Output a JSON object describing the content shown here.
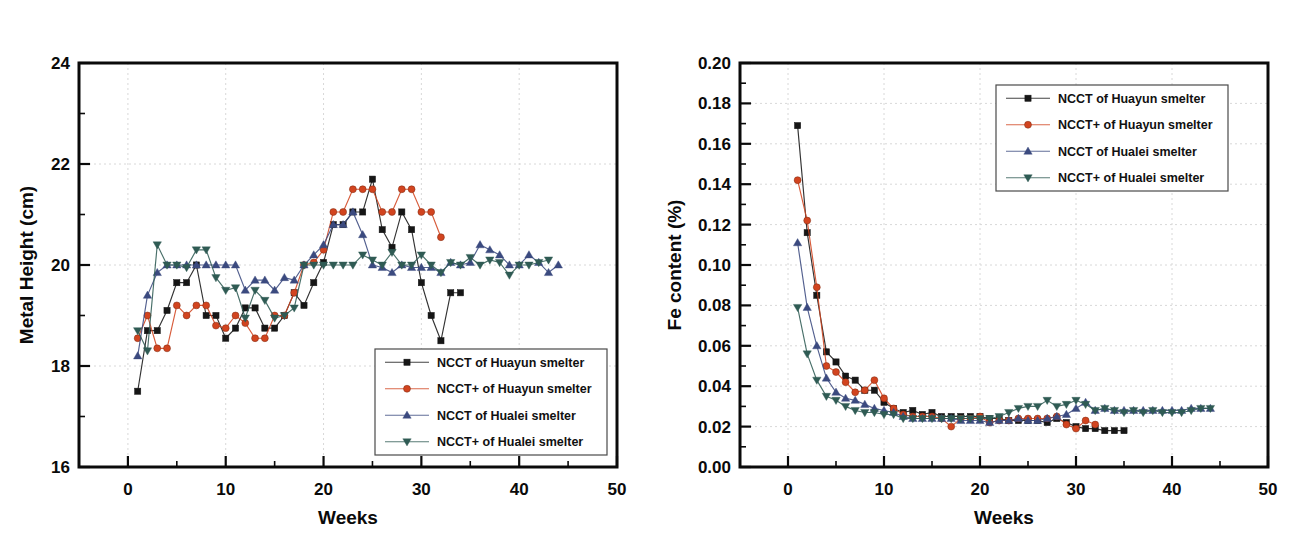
{
  "figure": {
    "background": "#ffffff",
    "panel_count": 2
  },
  "legend_entries": [
    {
      "label": "NCCT   of Huayun smelter",
      "color": "#161616",
      "marker": "square"
    },
    {
      "label": "NCCT+ of Huayun smelter",
      "color": "#d2441f",
      "marker": "circle"
    },
    {
      "label": "NCCT   of Hualei smelter",
      "color": "#3b4a7f",
      "marker": "triangle-up"
    },
    {
      "label": "NCCT+ of Hualei smelter",
      "color": "#2f5b54",
      "marker": "triangle-down"
    }
  ],
  "chart_data": [
    {
      "id": "metal-height",
      "type": "line",
      "title": "",
      "xlabel": "Weeks",
      "ylabel": "Metal Height (cm)",
      "xlim": [
        -5,
        50
      ],
      "ylim": [
        16,
        24
      ],
      "xticks": [
        0,
        10,
        20,
        30,
        40,
        50
      ],
      "xtick_labels": [
        "0",
        "10",
        "20",
        "30",
        "40",
        "50"
      ],
      "yticks": [
        16,
        18,
        20,
        22,
        24
      ],
      "ytick_labels": [
        "16",
        "18",
        "20",
        "22",
        "24"
      ],
      "x_minor_step": 5,
      "y_minor_step": 1,
      "grid": true,
      "legend_position": "bottom-right",
      "series": [
        {
          "name": "NCCT   of Huayun smelter",
          "color": "#161616",
          "marker": "square",
          "x": [
            1,
            2,
            3,
            4,
            5,
            6,
            7,
            8,
            9,
            10,
            11,
            12,
            13,
            14,
            15,
            16,
            17,
            18,
            19,
            20,
            21,
            22,
            23,
            24,
            25,
            26,
            27,
            28,
            29,
            30,
            31,
            32,
            33,
            34
          ],
          "values": [
            17.5,
            18.7,
            18.7,
            19.1,
            19.65,
            19.65,
            20.0,
            19.0,
            19.0,
            18.55,
            18.75,
            19.15,
            19.15,
            18.75,
            18.75,
            19.0,
            19.45,
            19.2,
            19.65,
            20.05,
            20.8,
            20.8,
            21.05,
            21.05,
            21.7,
            20.7,
            20.35,
            21.05,
            20.7,
            19.65,
            19.0,
            18.5,
            19.45,
            19.45
          ]
        },
        {
          "name": "NCCT+ of Huayun smelter",
          "color": "#d2441f",
          "marker": "circle",
          "x": [
            1,
            2,
            3,
            4,
            5,
            6,
            7,
            8,
            9,
            10,
            11,
            12,
            13,
            14,
            15,
            16,
            17,
            18,
            19,
            20,
            21,
            22,
            23,
            24,
            25,
            26,
            27,
            28,
            29,
            30,
            31,
            32
          ],
          "values": [
            18.55,
            19.0,
            18.35,
            18.35,
            19.2,
            19.0,
            19.2,
            19.2,
            18.8,
            18.75,
            19.0,
            18.85,
            18.55,
            18.55,
            19.0,
            19.0,
            19.45,
            20.0,
            20.05,
            20.3,
            21.05,
            21.05,
            21.5,
            21.5,
            21.5,
            21.05,
            21.05,
            21.5,
            21.5,
            21.05,
            21.05,
            20.55
          ]
        },
        {
          "name": "NCCT   of Hualei smelter",
          "color": "#3b4a7f",
          "marker": "triangle-up",
          "x": [
            1,
            2,
            3,
            4,
            5,
            6,
            7,
            8,
            9,
            10,
            11,
            12,
            13,
            14,
            15,
            16,
            17,
            18,
            19,
            20,
            21,
            22,
            23,
            24,
            25,
            26,
            27,
            28,
            29,
            30,
            31,
            32,
            33,
            34,
            35,
            36,
            37,
            38,
            39,
            40,
            41,
            42,
            43,
            44
          ],
          "values": [
            18.2,
            19.4,
            19.85,
            20.0,
            20.0,
            20.0,
            20.0,
            20.0,
            20.0,
            20.0,
            20.0,
            19.5,
            19.7,
            19.7,
            19.5,
            19.75,
            19.7,
            20.0,
            20.2,
            20.4,
            20.8,
            20.8,
            21.05,
            20.6,
            20.0,
            19.95,
            19.85,
            20.0,
            19.95,
            19.95,
            19.95,
            19.85,
            20.05,
            20.0,
            20.05,
            20.4,
            20.3,
            20.2,
            20.0,
            20.0,
            20.2,
            20.05,
            19.85,
            20.0
          ]
        },
        {
          "name": "NCCT+ of Hualei smelter",
          "color": "#2f5b54",
          "marker": "triangle-down",
          "x": [
            1,
            2,
            3,
            4,
            5,
            6,
            7,
            8,
            9,
            10,
            11,
            12,
            13,
            14,
            15,
            16,
            17,
            18,
            19,
            20,
            21,
            22,
            23,
            24,
            25,
            26,
            27,
            28,
            29,
            30,
            31,
            32,
            33,
            34,
            35,
            36,
            37,
            38,
            39,
            40,
            41,
            42,
            43
          ],
          "values": [
            18.7,
            18.3,
            20.4,
            20.0,
            20.0,
            19.95,
            20.3,
            20.3,
            19.75,
            19.5,
            19.55,
            18.95,
            19.5,
            19.3,
            18.95,
            19.0,
            19.15,
            20.0,
            20.0,
            20.0,
            20.0,
            20.0,
            20.0,
            20.2,
            20.1,
            20.0,
            20.25,
            20.0,
            20.0,
            20.2,
            20.0,
            19.85,
            20.05,
            20.0,
            20.15,
            20.0,
            20.1,
            20.05,
            19.8,
            20.0,
            20.0,
            20.05,
            20.1
          ]
        }
      ]
    },
    {
      "id": "fe-content",
      "type": "line",
      "title": "",
      "xlabel": "Weeks",
      "ylabel": "Fe content (%)",
      "xlim": [
        -5,
        50
      ],
      "ylim": [
        0.0,
        0.2
      ],
      "xticks": [
        0,
        10,
        20,
        30,
        40,
        50
      ],
      "xtick_labels": [
        "0",
        "10",
        "20",
        "30",
        "40",
        "50"
      ],
      "yticks": [
        0.0,
        0.02,
        0.04,
        0.06,
        0.08,
        0.1,
        0.12,
        0.14,
        0.16,
        0.18,
        0.2
      ],
      "ytick_labels": [
        "0.00",
        "0.02",
        "0.04",
        "0.06",
        "0.08",
        "0.10",
        "0.12",
        "0.14",
        "0.16",
        "0.18",
        "0.20"
      ],
      "x_minor_step": 5,
      "y_minor_step": 0.01,
      "grid": true,
      "legend_position": "top-right",
      "series": [
        {
          "name": "NCCT   of Huayun smelter",
          "color": "#161616",
          "marker": "square",
          "x": [
            1,
            2,
            3,
            4,
            5,
            6,
            7,
            8,
            9,
            10,
            11,
            12,
            13,
            14,
            15,
            16,
            17,
            18,
            19,
            20,
            21,
            22,
            23,
            24,
            25,
            26,
            27,
            28,
            29,
            30,
            31,
            32,
            33,
            34,
            35
          ],
          "values": [
            0.169,
            0.116,
            0.085,
            0.057,
            0.052,
            0.045,
            0.043,
            0.038,
            0.038,
            0.032,
            0.029,
            0.027,
            0.028,
            0.026,
            0.027,
            0.025,
            0.025,
            0.025,
            0.025,
            0.025,
            0.024,
            0.024,
            0.023,
            0.023,
            0.023,
            0.023,
            0.022,
            0.024,
            0.022,
            0.02,
            0.019,
            0.019,
            0.018,
            0.018,
            0.018
          ]
        },
        {
          "name": "NCCT+ of Huayun smelter",
          "color": "#d2441f",
          "marker": "circle",
          "x": [
            1,
            2,
            3,
            4,
            5,
            6,
            7,
            8,
            9,
            10,
            11,
            12,
            13,
            14,
            15,
            16,
            17,
            18,
            19,
            20,
            21,
            22,
            23,
            24,
            25,
            26,
            27,
            28,
            29,
            30,
            31,
            32
          ],
          "values": [
            0.142,
            0.122,
            0.089,
            0.05,
            0.047,
            0.042,
            0.037,
            0.038,
            0.043,
            0.034,
            0.029,
            0.026,
            0.025,
            0.025,
            0.025,
            0.024,
            0.02,
            0.024,
            0.024,
            0.025,
            0.022,
            0.023,
            0.023,
            0.024,
            0.024,
            0.024,
            0.024,
            0.025,
            0.021,
            0.019,
            0.023,
            0.021
          ]
        },
        {
          "name": "NCCT   of Hualei smelter",
          "color": "#3b4a7f",
          "marker": "triangle-up",
          "x": [
            1,
            2,
            3,
            4,
            5,
            6,
            7,
            8,
            9,
            10,
            11,
            12,
            13,
            14,
            15,
            16,
            17,
            18,
            19,
            20,
            21,
            22,
            23,
            24,
            25,
            26,
            27,
            28,
            29,
            30,
            31,
            32,
            33,
            34,
            35,
            36,
            37,
            38,
            39,
            40,
            41,
            42,
            43,
            44
          ],
          "values": [
            0.111,
            0.079,
            0.06,
            0.044,
            0.037,
            0.034,
            0.033,
            0.031,
            0.029,
            0.028,
            0.027,
            0.025,
            0.024,
            0.024,
            0.024,
            0.024,
            0.024,
            0.023,
            0.023,
            0.023,
            0.022,
            0.023,
            0.023,
            0.024,
            0.023,
            0.023,
            0.024,
            0.025,
            0.026,
            0.029,
            0.032,
            0.028,
            0.029,
            0.028,
            0.028,
            0.028,
            0.028,
            0.028,
            0.028,
            0.028,
            0.028,
            0.029,
            0.029,
            0.029
          ]
        },
        {
          "name": "NCCT+ of Hualei smelter",
          "color": "#2f5b54",
          "marker": "triangle-down",
          "x": [
            1,
            2,
            3,
            4,
            5,
            6,
            7,
            8,
            9,
            10,
            11,
            12,
            13,
            14,
            15,
            16,
            17,
            18,
            19,
            20,
            21,
            22,
            23,
            24,
            25,
            26,
            27,
            28,
            29,
            30,
            31,
            32,
            33,
            34,
            35,
            36,
            37,
            38,
            39,
            40,
            41,
            42,
            43,
            44
          ],
          "values": [
            0.079,
            0.056,
            0.043,
            0.035,
            0.033,
            0.03,
            0.028,
            0.027,
            0.027,
            0.026,
            0.026,
            0.024,
            0.024,
            0.024,
            0.024,
            0.024,
            0.024,
            0.024,
            0.024,
            0.024,
            0.024,
            0.025,
            0.027,
            0.029,
            0.03,
            0.03,
            0.033,
            0.03,
            0.031,
            0.033,
            0.031,
            0.028,
            0.029,
            0.028,
            0.027,
            0.028,
            0.027,
            0.028,
            0.027,
            0.027,
            0.027,
            0.028,
            0.029,
            0.029
          ]
        }
      ]
    }
  ]
}
